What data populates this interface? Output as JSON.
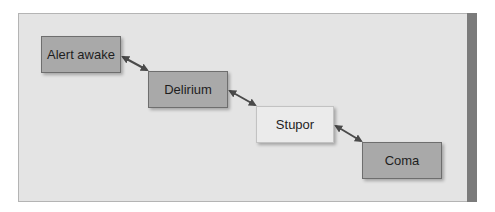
{
  "diagram": {
    "type": "flow",
    "colors": {
      "panel_background": "#e4e4e4",
      "panel_border": "#b4b4b4",
      "right_stripe": "#7b7b7b",
      "dark_box_fill": "#a9a9a9",
      "light_box_fill": "#ebebeb",
      "arrow": "#4a4a4a"
    },
    "nodes": [
      {
        "id": "alert-awake",
        "label": "Alert awake",
        "style": "dark"
      },
      {
        "id": "delirium",
        "label": "Delirium",
        "style": "dark"
      },
      {
        "id": "stupor",
        "label": "Stupor",
        "style": "light"
      },
      {
        "id": "coma",
        "label": "Coma",
        "style": "dark"
      }
    ],
    "edges": [
      {
        "from": "alert-awake",
        "to": "delirium",
        "direction": "bidirectional"
      },
      {
        "from": "delirium",
        "to": "stupor",
        "direction": "bidirectional"
      },
      {
        "from": "stupor",
        "to": "coma",
        "direction": "bidirectional"
      }
    ]
  }
}
